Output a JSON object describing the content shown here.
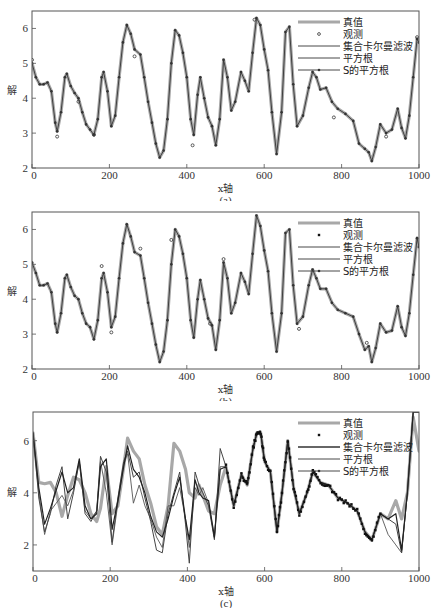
{
  "figure": {
    "top_crop_text": "",
    "panels": [
      {
        "id": "a",
        "caption": "(a)",
        "top": 0
      },
      {
        "id": "b",
        "caption": "(b)",
        "top": 201
      },
      {
        "id": "c",
        "caption": "(c)",
        "top": 401
      }
    ]
  },
  "legend": {
    "items": [
      {
        "label": "真值",
        "style": "thick-gray"
      },
      {
        "label": "观测",
        "style": "dot"
      },
      {
        "label": "集合卡尔曼滤波",
        "style": "line"
      },
      {
        "label": "平方根",
        "style": "line"
      },
      {
        "label": "S的平方根",
        "style": "line-dot"
      }
    ]
  },
  "colors": {
    "truth": "#a8a8a8",
    "observation": "#333333",
    "enkf": "#222222",
    "sqrt": "#444444",
    "sqrt_s": "#555555",
    "axis": "#555555"
  },
  "chart_data": [
    {
      "type": "line",
      "title": "(a)",
      "xlabel": "x轴",
      "ylabel": "解",
      "xlim": [
        0,
        1000
      ],
      "ylim": [
        2,
        6.5
      ],
      "xticks": [
        0,
        200,
        400,
        600,
        800,
        1000
      ],
      "yticks": [
        2,
        3,
        4,
        5,
        6
      ],
      "grid": false,
      "legend_position": "upper right",
      "x": [
        0,
        10,
        20,
        30,
        40,
        50,
        60,
        65,
        75,
        85,
        90,
        100,
        110,
        120,
        130,
        140,
        150,
        160,
        170,
        180,
        185,
        195,
        205,
        215,
        225,
        235,
        245,
        255,
        265,
        280,
        290,
        300,
        310,
        320,
        330,
        340,
        350,
        360,
        370,
        380,
        390,
        400,
        410,
        418,
        428,
        435,
        445,
        455,
        465,
        475,
        485,
        495,
        505,
        515,
        525,
        540,
        550,
        560,
        570,
        580,
        590,
        600,
        610,
        620,
        632,
        645,
        655,
        665,
        675,
        685,
        700,
        715,
        725,
        735,
        745,
        760,
        775,
        790,
        810,
        830,
        845,
        860,
        870,
        878,
        888,
        900,
        915,
        930,
        945,
        955,
        965,
        975,
        985,
        995,
        1000
      ],
      "series": [
        {
          "name": "真值",
          "values": [
            5.0,
            4.6,
            4.4,
            4.4,
            4.45,
            4.2,
            3.3,
            3.05,
            3.6,
            4.6,
            4.7,
            4.35,
            4.15,
            4.0,
            3.6,
            3.25,
            3.1,
            2.95,
            3.4,
            4.6,
            4.75,
            4.2,
            3.2,
            3.5,
            4.6,
            5.6,
            6.1,
            5.85,
            5.4,
            5.25,
            4.6,
            3.9,
            3.3,
            2.7,
            2.3,
            2.5,
            3.4,
            5.0,
            5.95,
            5.8,
            5.3,
            4.6,
            3.4,
            2.95,
            4.1,
            4.6,
            4.0,
            3.45,
            3.2,
            2.65,
            3.4,
            5.1,
            4.6,
            3.65,
            3.9,
            4.75,
            4.5,
            4.2,
            5.3,
            6.3,
            6.1,
            5.4,
            4.8,
            3.6,
            2.4,
            3.6,
            5.9,
            6.05,
            4.4,
            3.2,
            3.5,
            4.3,
            4.75,
            4.6,
            4.25,
            4.3,
            3.9,
            3.7,
            3.55,
            3.35,
            2.7,
            2.55,
            2.45,
            2.2,
            2.6,
            3.25,
            3.0,
            3.1,
            3.7,
            3.15,
            2.85,
            3.5,
            4.6,
            5.7,
            5.6
          ]
        },
        {
          "name": "集合卡尔曼滤波",
          "values": "tracks 真值 closely"
        },
        {
          "name": "平方根",
          "values": "tracks 真值 closely"
        },
        {
          "name": "S的平方根",
          "values": "tracks 真值 closely"
        }
      ],
      "observations": {
        "name": "观测",
        "x": [
          0,
          65,
          120,
          160,
          265,
          415,
          575,
          780,
          915,
          995
        ],
        "values": [
          5.1,
          2.9,
          3.9,
          2.95,
          5.2,
          2.65,
          6.25,
          3.45,
          2.9,
          5.75
        ]
      }
    },
    {
      "type": "line",
      "title": "(b)",
      "xlabel": "x轴",
      "ylabel": "解",
      "xlim": [
        0,
        1000
      ],
      "ylim": [
        2,
        6.5
      ],
      "xticks": [
        0,
        200,
        400,
        600,
        800,
        1000
      ],
      "yticks": [
        2,
        3,
        4,
        5,
        6
      ],
      "grid": false,
      "legend_position": "upper right",
      "x": [
        0,
        10,
        20,
        30,
        40,
        50,
        60,
        65,
        75,
        85,
        90,
        100,
        110,
        120,
        130,
        140,
        150,
        160,
        170,
        180,
        185,
        195,
        205,
        215,
        225,
        235,
        245,
        255,
        265,
        280,
        290,
        300,
        310,
        320,
        330,
        340,
        350,
        360,
        370,
        380,
        390,
        400,
        410,
        418,
        428,
        435,
        445,
        455,
        465,
        475,
        485,
        495,
        505,
        515,
        525,
        540,
        550,
        560,
        570,
        580,
        590,
        600,
        610,
        620,
        632,
        645,
        655,
        665,
        675,
        685,
        700,
        715,
        725,
        735,
        745,
        760,
        775,
        790,
        810,
        830,
        845,
        860,
        870,
        878,
        888,
        900,
        915,
        930,
        945,
        955,
        965,
        975,
        985,
        995,
        1000
      ],
      "series": [
        {
          "name": "真值",
          "values": [
            5.05,
            4.75,
            4.4,
            4.4,
            4.45,
            4.2,
            3.3,
            3.05,
            3.6,
            4.6,
            4.7,
            4.35,
            4.1,
            4.0,
            3.6,
            3.3,
            3.2,
            2.85,
            3.4,
            4.6,
            4.75,
            4.2,
            3.2,
            3.5,
            4.6,
            5.6,
            6.15,
            5.8,
            5.35,
            5.25,
            4.6,
            3.9,
            3.3,
            2.7,
            2.2,
            2.5,
            3.4,
            5.0,
            6.0,
            5.8,
            5.3,
            4.6,
            3.4,
            2.9,
            4.0,
            4.55,
            4.0,
            3.45,
            3.25,
            2.55,
            3.4,
            5.05,
            4.6,
            3.6,
            3.9,
            4.75,
            4.5,
            4.15,
            5.3,
            6.4,
            6.1,
            5.4,
            4.8,
            3.6,
            2.5,
            3.6,
            5.9,
            6.0,
            4.4,
            3.3,
            3.5,
            4.4,
            4.85,
            4.6,
            4.3,
            4.3,
            3.9,
            3.7,
            3.6,
            3.5,
            3.0,
            2.55,
            2.65,
            2.2,
            2.6,
            3.3,
            3.05,
            3.1,
            3.8,
            3.2,
            2.95,
            3.6,
            4.7,
            5.75,
            5.5
          ]
        }
      ],
      "observations": {
        "name": "观测",
        "x": [
          180,
          205,
          280,
          360,
          460,
          495,
          690,
          865
        ],
        "values": [
          4.95,
          3.05,
          5.45,
          5.7,
          3.3,
          5.15,
          3.15,
          2.75
        ]
      }
    },
    {
      "type": "line",
      "title": "(c)",
      "xlabel": "x轴",
      "ylabel": "解",
      "xlim": [
        0,
        1000
      ],
      "ylim": [
        1,
        7.1
      ],
      "xticks": [
        0,
        200,
        400,
        600,
        800,
        1000
      ],
      "yticks": [
        2,
        4,
        6
      ],
      "grid": false,
      "legend_position": "upper right",
      "observation_range": [
        500,
        900
      ],
      "x": [
        0,
        15,
        30,
        45,
        60,
        75,
        90,
        105,
        120,
        135,
        150,
        165,
        175,
        190,
        205,
        220,
        235,
        245,
        260,
        275,
        290,
        305,
        320,
        335,
        350,
        365,
        380,
        395,
        405,
        420,
        430,
        440,
        455,
        470,
        485,
        500,
        520,
        540,
        555,
        570,
        580,
        590,
        600,
        615,
        632,
        645,
        660,
        675,
        690,
        710,
        725,
        745,
        765,
        790,
        815,
        840,
        860,
        878,
        900,
        920,
        940,
        955,
        970,
        985,
        1000
      ],
      "series": [
        {
          "name": "真值",
          "values": [
            6.3,
            4.4,
            4.35,
            4.4,
            4.0,
            3.1,
            3.9,
            4.6,
            4.5,
            4.0,
            3.2,
            2.9,
            3.4,
            5.0,
            3.2,
            3.5,
            5.0,
            6.1,
            5.6,
            5.3,
            4.3,
            3.6,
            2.7,
            2.4,
            3.5,
            5.9,
            5.6,
            4.9,
            4.0,
            3.8,
            4.3,
            3.9,
            3.3,
            3.2,
            4.3,
            5.0,
            3.5,
            4.7,
            4.3,
            5.7,
            6.3,
            6.3,
            5.2,
            4.8,
            2.5,
            4.0,
            6.0,
            4.2,
            3.2,
            4.0,
            4.8,
            4.4,
            4.3,
            3.8,
            3.6,
            3.3,
            2.5,
            2.2,
            3.2,
            3.0,
            3.7,
            3.0,
            4.0,
            6.9,
            5.6
          ]
        },
        {
          "name": "集合卡尔曼滤波",
          "values": [
            6.3,
            4.2,
            2.8,
            3.4,
            4.1,
            4.8,
            4.0,
            4.2,
            5.3,
            3.5,
            3.0,
            3.2,
            5.0,
            5.3,
            2.6,
            3.7,
            5.0,
            5.8,
            4.9,
            4.6,
            4.0,
            3.1,
            2.5,
            2.3,
            3.0,
            3.9,
            4.6,
            3.0,
            2.2,
            4.5,
            4.0,
            3.8,
            3.7,
            2.3,
            4.9,
            5.0,
            3.5,
            4.7,
            4.3,
            5.7,
            6.3,
            6.3,
            5.2,
            4.8,
            2.5,
            4.0,
            6.0,
            4.2,
            3.2,
            4.0,
            4.8,
            4.4,
            4.3,
            3.8,
            3.6,
            3.3,
            2.5,
            2.2,
            3.2,
            3.0,
            3.2,
            1.8,
            4.0,
            7.1,
            7.1
          ]
        },
        {
          "name": "平方根",
          "values": [
            6.3,
            3.8,
            2.5,
            3.2,
            4.3,
            5.0,
            3.0,
            4.0,
            5.2,
            3.2,
            2.9,
            3.3,
            5.4,
            4.8,
            2.1,
            3.8,
            5.2,
            5.6,
            4.6,
            4.8,
            3.8,
            2.9,
            1.8,
            1.7,
            3.2,
            4.0,
            4.8,
            2.8,
            1.3,
            4.8,
            4.3,
            4.0,
            3.5,
            2.2,
            5.7,
            5.0,
            3.5,
            4.7,
            4.3,
            5.7,
            6.3,
            6.3,
            5.2,
            4.8,
            2.5,
            4.0,
            6.0,
            4.2,
            3.2,
            4.0,
            4.8,
            4.4,
            4.3,
            3.8,
            3.6,
            3.3,
            2.5,
            2.2,
            3.2,
            3.0,
            2.8,
            1.7,
            4.0,
            7.1,
            7.1
          ]
        },
        {
          "name": "S的平方根",
          "values": [
            6.3,
            4.0,
            2.4,
            3.3,
            3.6,
            3.9,
            3.5,
            4.1,
            5.2,
            3.3,
            3.0,
            3.3,
            5.2,
            4.0,
            2.0,
            3.6,
            5.1,
            5.5,
            3.6,
            4.3,
            3.5,
            3.0,
            2.3,
            1.9,
            3.5,
            3.5,
            4.2,
            3.0,
            1.9,
            4.2,
            3.9,
            4.2,
            3.6,
            2.3,
            5.0,
            5.0,
            3.5,
            4.7,
            4.3,
            5.7,
            6.3,
            6.3,
            5.2,
            4.8,
            2.5,
            4.0,
            6.0,
            4.2,
            3.2,
            4.0,
            4.8,
            4.4,
            4.3,
            3.8,
            3.6,
            3.3,
            2.5,
            2.2,
            3.2,
            2.4,
            2.0,
            1.7,
            4.0,
            7.1,
            7.1
          ]
        }
      ]
    }
  ]
}
